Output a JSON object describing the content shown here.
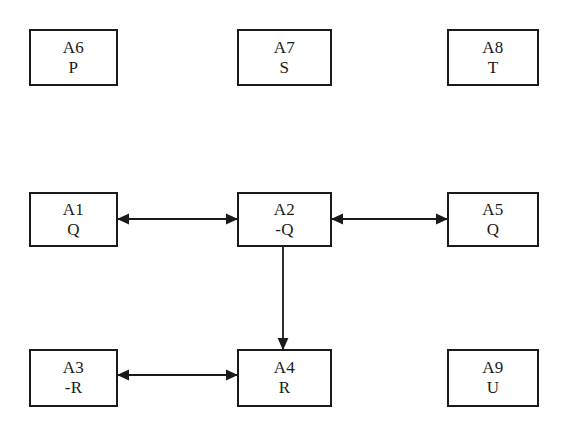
{
  "diagram": {
    "title": "",
    "background_color": "#ffffff",
    "stroke_color": "#1a1a1a",
    "nodes": [
      {
        "id": "A6",
        "proposition": "P",
        "x": 29,
        "y": 29,
        "w": 89,
        "h": 57
      },
      {
        "id": "A7",
        "proposition": "S",
        "x": 237,
        "y": 29,
        "w": 95,
        "h": 57
      },
      {
        "id": "A8",
        "proposition": "T",
        "x": 447,
        "y": 29,
        "w": 92,
        "h": 57
      },
      {
        "id": "A1",
        "proposition": "Q",
        "x": 29,
        "y": 192,
        "w": 89,
        "h": 55
      },
      {
        "id": "A2",
        "proposition": "-Q",
        "x": 237,
        "y": 192,
        "w": 95,
        "h": 55
      },
      {
        "id": "A5",
        "proposition": "Q",
        "x": 447,
        "y": 192,
        "w": 92,
        "h": 55
      },
      {
        "id": "A3",
        "proposition": "-R",
        "x": 29,
        "y": 349,
        "w": 89,
        "h": 58
      },
      {
        "id": "A4",
        "proposition": "R",
        "x": 237,
        "y": 349,
        "w": 95,
        "h": 58
      },
      {
        "id": "A9",
        "proposition": "U",
        "x": 447,
        "y": 349,
        "w": 92,
        "h": 58
      }
    ],
    "edges": [
      {
        "name": "edge-a1-a2",
        "from": "A1",
        "to": "A2",
        "kind": "double-arrow",
        "orientation": "horizontal",
        "x1": 118,
        "y1": 219,
        "x2": 237,
        "y2": 219
      },
      {
        "name": "edge-a2-a5",
        "from": "A2",
        "to": "A5",
        "kind": "double-arrow",
        "orientation": "horizontal",
        "x1": 332,
        "y1": 219,
        "x2": 447,
        "y2": 219
      },
      {
        "name": "edge-a2-a4",
        "from": "A2",
        "to": "A4",
        "kind": "single-arrow",
        "orientation": "vertical",
        "x1": 283,
        "y1": 247,
        "x2": 283,
        "y2": 349
      },
      {
        "name": "edge-a3-a4",
        "from": "A3",
        "to": "A4",
        "kind": "double-arrow",
        "orientation": "horizontal",
        "x1": 118,
        "y1": 375,
        "x2": 237,
        "y2": 375
      }
    ]
  }
}
